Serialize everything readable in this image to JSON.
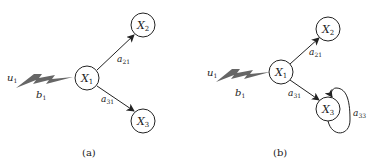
{
  "panels": [
    {
      "caption": "(a)",
      "input": {
        "u": "u",
        "u_sub": "1",
        "b": "b",
        "b_sub": "1"
      },
      "nodes": [
        {
          "id": "X1",
          "name": "X",
          "sub": "1"
        },
        {
          "id": "X2",
          "name": "X",
          "sub": "2"
        },
        {
          "id": "X3",
          "name": "X",
          "sub": "3"
        }
      ],
      "edges": [
        {
          "from": "X1",
          "to": "X2",
          "label": "a",
          "sub": "21"
        },
        {
          "from": "X1",
          "to": "X3",
          "label": "a",
          "sub": "31"
        }
      ]
    },
    {
      "caption": "(b)",
      "input": {
        "u": "u",
        "u_sub": "1",
        "b": "b",
        "b_sub": "1"
      },
      "nodes": [
        {
          "id": "X1",
          "name": "X",
          "sub": "1"
        },
        {
          "id": "X2",
          "name": "X",
          "sub": "2"
        },
        {
          "id": "X3",
          "name": "X",
          "sub": "3"
        }
      ],
      "edges": [
        {
          "from": "X1",
          "to": "X2",
          "label": "a",
          "sub": "21"
        },
        {
          "from": "X1",
          "to": "X3",
          "label": "a",
          "sub": "31"
        },
        {
          "from": "X3",
          "to": "X3",
          "label": "a",
          "sub": "33"
        }
      ]
    }
  ],
  "colors": {
    "stroke": "#222222",
    "bolt": "#666666"
  }
}
